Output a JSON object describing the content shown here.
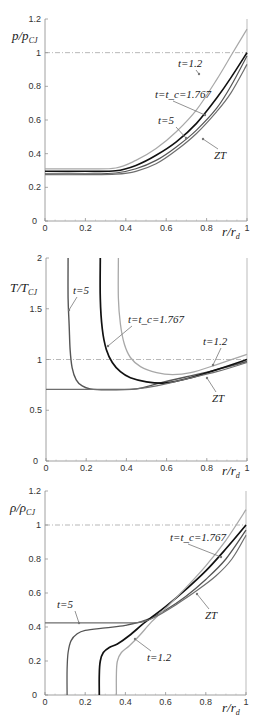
{
  "chart_data": [
    {
      "type": "line",
      "title": "",
      "xlabel": "r/r_d",
      "ylabel": "p/p_CJ",
      "xlim": [
        0,
        1
      ],
      "ylim": [
        0,
        1.2
      ],
      "xticks": [
        "0",
        "0.2",
        "0.4",
        "0.6",
        "0.8",
        "1"
      ],
      "yticks": [
        "0",
        "0.2",
        "0.4",
        "0.6",
        "0.8",
        "1",
        "1.2"
      ],
      "grid": false,
      "reference_line": {
        "y": 1,
        "style": "dash-dot"
      },
      "series": [
        {
          "name": "t=1.2",
          "color": "#a8a8a8",
          "width": 1.2,
          "x": [
            0,
            0.2,
            0.35,
            0.45,
            0.55,
            0.65,
            0.75,
            0.85,
            0.92,
            1.0
          ],
          "y": [
            0.31,
            0.31,
            0.315,
            0.36,
            0.43,
            0.53,
            0.66,
            0.84,
            0.98,
            1.14
          ]
        },
        {
          "name": "t=t_c=1.767",
          "color": "#111111",
          "width": 1.6,
          "x": [
            0,
            0.2,
            0.35,
            0.45,
            0.55,
            0.65,
            0.75,
            0.85,
            0.92,
            1.0
          ],
          "y": [
            0.295,
            0.295,
            0.298,
            0.33,
            0.39,
            0.47,
            0.58,
            0.73,
            0.85,
            1.0
          ]
        },
        {
          "name": "t=5",
          "color": "#555555",
          "width": 1.2,
          "x": [
            0,
            0.2,
            0.35,
            0.45,
            0.55,
            0.65,
            0.75,
            0.85,
            0.92,
            1.0
          ],
          "y": [
            0.28,
            0.28,
            0.285,
            0.31,
            0.36,
            0.44,
            0.54,
            0.67,
            0.8,
            0.98
          ]
        },
        {
          "name": "ZT",
          "color": "#6e6e6e",
          "width": 1.2,
          "x": [
            0,
            0.2,
            0.35,
            0.45,
            0.55,
            0.65,
            0.75,
            0.85,
            0.92,
            1.0
          ],
          "y": [
            0.275,
            0.275,
            0.278,
            0.295,
            0.34,
            0.42,
            0.52,
            0.65,
            0.76,
            0.93
          ]
        }
      ],
      "annotations": [
        {
          "text": "t=1.2",
          "at": [
            0.87,
            0.82
          ]
        },
        {
          "text": "t=t_c=1.767",
          "at": [
            0.8,
            0.63
          ]
        },
        {
          "text": "t=5",
          "at": [
            0.71,
            0.5
          ]
        },
        {
          "text": "ZT",
          "at": [
            0.8,
            0.48
          ]
        }
      ]
    },
    {
      "type": "line",
      "title": "",
      "xlabel": "r/r_d",
      "ylabel": "T/T_CJ",
      "xlim": [
        0,
        1
      ],
      "ylim": [
        0,
        2
      ],
      "xticks": [
        "0",
        "0.2",
        "0.4",
        "0.6",
        "0.8",
        "1"
      ],
      "yticks": [
        "0",
        "0.5",
        "1",
        "1.5",
        "2"
      ],
      "grid": false,
      "reference_line": {
        "y": 1,
        "style": "dash-dot"
      },
      "series": [
        {
          "name": "t=5",
          "color": "#555555",
          "width": 1.4,
          "x": [
            0.11,
            0.11,
            0.115,
            0.12,
            0.13,
            0.15,
            0.18,
            0.22,
            0.3,
            0.45,
            0.55,
            0.7,
            0.85,
            1.0
          ],
          "y": [
            2.0,
            1.6,
            1.35,
            1.1,
            0.92,
            0.8,
            0.74,
            0.71,
            0.7,
            0.71,
            0.76,
            0.83,
            0.9,
            0.98
          ]
        },
        {
          "name": "t=t_c=1.767",
          "color": "#111111",
          "width": 1.7,
          "x": [
            0.27,
            0.27,
            0.28,
            0.3,
            0.33,
            0.37,
            0.42,
            0.5,
            0.6,
            0.7,
            0.85,
            1.0
          ],
          "y": [
            2.0,
            1.6,
            1.3,
            1.1,
            0.97,
            0.88,
            0.82,
            0.78,
            0.77,
            0.81,
            0.9,
            1.0
          ]
        },
        {
          "name": "t=1.2",
          "color": "#a8a8a8",
          "width": 1.3,
          "x": [
            0.36,
            0.36,
            0.37,
            0.39,
            0.42,
            0.47,
            0.55,
            0.63,
            0.72,
            0.85,
            1.0
          ],
          "y": [
            2.0,
            1.6,
            1.35,
            1.15,
            1.02,
            0.93,
            0.87,
            0.85,
            0.87,
            0.95,
            1.05
          ]
        },
        {
          "name": "ZT",
          "color": "#6e6e6e",
          "width": 1.2,
          "x": [
            0,
            0.2,
            0.35,
            0.45,
            0.55,
            0.7,
            0.85,
            1.0
          ],
          "y": [
            0.705,
            0.705,
            0.705,
            0.71,
            0.74,
            0.81,
            0.88,
            0.97
          ]
        }
      ],
      "annotations": [
        {
          "text": "t=5",
          "at": [
            0.12,
            1.45
          ]
        },
        {
          "text": "t=t_c=1.767",
          "at": [
            0.31,
            1.1
          ]
        },
        {
          "text": "t=1.2",
          "at": [
            0.83,
            0.92
          ]
        },
        {
          "text": "ZT",
          "at": [
            0.8,
            0.78
          ]
        }
      ]
    },
    {
      "type": "line",
      "title": "",
      "xlabel": "r/r_d",
      "ylabel": "ρ/ρ_CJ",
      "xlim": [
        0,
        1
      ],
      "ylim": [
        0,
        1.2
      ],
      "xticks": [
        "0",
        "0.2",
        "0.4",
        "0.6",
        "0.8",
        "1"
      ],
      "yticks": [
        "0",
        "0.2",
        "0.4",
        "0.6",
        "0.8",
        "1",
        "1.2"
      ],
      "grid": false,
      "reference_line": {
        "y": 1,
        "style": "dash-dot"
      },
      "series": [
        {
          "name": "t=5",
          "color": "#555555",
          "width": 1.3,
          "x": [
            0.11,
            0.11,
            0.115,
            0.13,
            0.16,
            0.2,
            0.3,
            0.4,
            0.5,
            0.6,
            0.7,
            0.8,
            0.9,
            1.0
          ],
          "y": [
            0.0,
            0.15,
            0.25,
            0.32,
            0.36,
            0.38,
            0.395,
            0.41,
            0.44,
            0.5,
            0.58,
            0.68,
            0.8,
            0.97
          ]
        },
        {
          "name": "t=t_c=1.767",
          "color": "#111111",
          "width": 1.7,
          "x": [
            0.27,
            0.27,
            0.275,
            0.29,
            0.32,
            0.36,
            0.42,
            0.5,
            0.6,
            0.7,
            0.8,
            0.9,
            1.0
          ],
          "y": [
            0.0,
            0.12,
            0.2,
            0.25,
            0.28,
            0.3,
            0.35,
            0.43,
            0.52,
            0.62,
            0.73,
            0.86,
            1.0
          ]
        },
        {
          "name": "t=1.2",
          "color": "#a8a8a8",
          "width": 1.3,
          "x": [
            0.355,
            0.355,
            0.36,
            0.38,
            0.42,
            0.47,
            0.53,
            0.6,
            0.7,
            0.8,
            0.9,
            1.0
          ],
          "y": [
            0.0,
            0.12,
            0.2,
            0.25,
            0.29,
            0.35,
            0.43,
            0.51,
            0.63,
            0.76,
            0.91,
            1.09
          ]
        },
        {
          "name": "ZT",
          "color": "#6e6e6e",
          "width": 1.2,
          "x": [
            0,
            0.2,
            0.4,
            0.48,
            0.55,
            0.65,
            0.75,
            0.85,
            0.93,
            1.0
          ],
          "y": [
            0.425,
            0.425,
            0.425,
            0.428,
            0.46,
            0.53,
            0.61,
            0.7,
            0.8,
            0.94
          ]
        }
      ],
      "annotations": [
        {
          "text": "t=t_c=1.767",
          "at": [
            0.87,
            0.81
          ]
        },
        {
          "text": "t=5",
          "at": [
            0.18,
            0.38
          ]
        },
        {
          "text": "ZT",
          "at": [
            0.77,
            0.59
          ]
        },
        {
          "text": "t=1.2",
          "at": [
            0.45,
            0.31
          ]
        }
      ]
    }
  ],
  "labels": {
    "p1_ylabel_main": "p/p",
    "p1_ylabel_sub": "CJ",
    "p2_ylabel_main": "T/T",
    "p2_ylabel_sub": "CJ",
    "p3_ylabel_main": "ρ/ρ",
    "p3_ylabel_sub": "CJ",
    "xlabel_main": "r/r",
    "xlabel_sub": "d"
  }
}
